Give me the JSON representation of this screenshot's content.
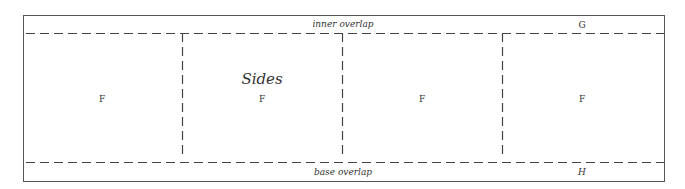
{
  "diagram": {
    "title": "Sides",
    "top_strip": {
      "label": "inner overlap",
      "marker": "G"
    },
    "bottom_strip": {
      "label": "base overlap",
      "marker": "H"
    },
    "panels": [
      {
        "label": "F"
      },
      {
        "label": "F"
      },
      {
        "label": "F"
      },
      {
        "label": "F"
      }
    ],
    "colors": {
      "line": "#555555",
      "dash": "#444444",
      "text": "#333333",
      "background": "#ffffff"
    }
  }
}
